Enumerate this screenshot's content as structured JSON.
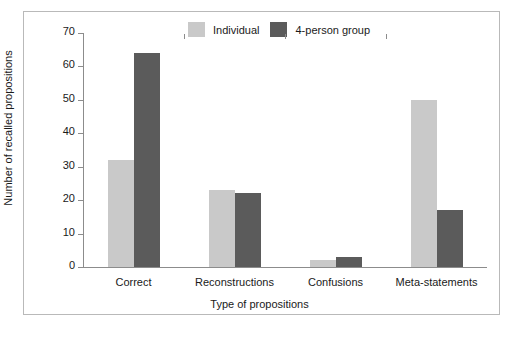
{
  "chart_data": {
    "type": "bar",
    "title": "",
    "xlabel": "Type of propositions",
    "ylabel": "Number of recalled propositions",
    "categories": [
      "Correct",
      "Reconstructions",
      "Confusions",
      "Meta-statements"
    ],
    "series": [
      {
        "name": "Individual",
        "color": "#c9c9c9",
        "values": [
          32,
          23,
          2,
          50
        ]
      },
      {
        "name": "4-person group",
        "color": "#5b5b5b",
        "values": [
          64,
          22,
          3,
          17
        ]
      }
    ],
    "ylim": [
      0,
      70
    ],
    "yticks": [
      0,
      10,
      20,
      30,
      40,
      50,
      60,
      70
    ],
    "ytick_labels": [
      "0",
      "10",
      "20",
      "30",
      "40",
      "50",
      "60",
      "70"
    ],
    "grid": false,
    "legend_position": "top-center"
  },
  "legend": {
    "items": [
      {
        "label": "Individual",
        "swatch": "light-gray-swatch"
      },
      {
        "label": "4-person group",
        "swatch": "dark-gray-swatch"
      }
    ]
  },
  "colors": {
    "individual": "#c9c9c9",
    "group": "#5b5b5b",
    "axis": "#8c8c8c",
    "frame": "#b9b9b9",
    "text": "#1a1a1a",
    "background": "#ffffff"
  }
}
